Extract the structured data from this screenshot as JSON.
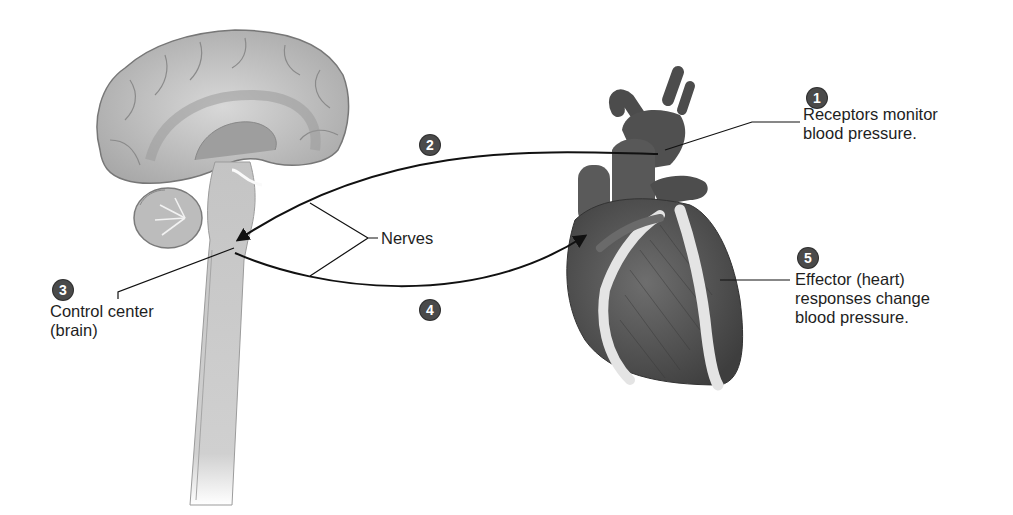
{
  "diagram": {
    "type": "homeostasis-feedback-loop",
    "steps": [
      {
        "number": "1",
        "text_lines": [
          "Receptors monitor",
          "blood pressure."
        ]
      },
      {
        "number": "2",
        "text_lines": []
      },
      {
        "number": "3",
        "text_lines": [
          "Control center",
          "(brain)"
        ]
      },
      {
        "number": "4",
        "text_lines": []
      },
      {
        "number": "5",
        "text_lines": [
          "Effector (heart)",
          "responses change",
          "blood pressure."
        ]
      }
    ],
    "nerves_label": "Nerves",
    "colors": {
      "badge": "#4a4a4a",
      "line": "#111111",
      "brain": "#bdbdbd",
      "heart": "#555555",
      "fat": "#e6e6e6"
    }
  }
}
